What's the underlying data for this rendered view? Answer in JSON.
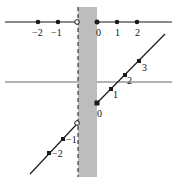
{
  "diagram": {
    "colors": {
      "line": "#1a1a1a",
      "band": "#bdbdbd",
      "axis": "#555555"
    },
    "top_line": {
      "left_points": [
        {
          "label": "−2",
          "x": 38
        },
        {
          "label": "−1",
          "x": 58
        }
      ],
      "open_point": {
        "x": 77
      },
      "right_points": [
        {
          "label": "0",
          "x": 97
        },
        {
          "label": "1",
          "x": 117
        },
        {
          "label": "2",
          "x": 137
        }
      ]
    },
    "slanted_line": {
      "upper_points": [
        {
          "label": "0",
          "x": 97,
          "y": 103
        },
        {
          "label": "1",
          "x": 111,
          "y": 89
        },
        {
          "label": "2",
          "x": 125,
          "y": 75
        },
        {
          "label": "3",
          "x": 139,
          "y": 61
        }
      ],
      "lower_points": [
        {
          "label": "−1",
          "x": 63,
          "y": 139
        },
        {
          "label": "−2",
          "x": 49,
          "y": 153
        }
      ],
      "open_point": {
        "x": 77,
        "y": 123
      }
    },
    "labels": {
      "top_m2": "−2",
      "top_m1": "−1",
      "top_0": "0",
      "top_1": "1",
      "top_2": "2",
      "slant_0": "0",
      "slant_1": "1",
      "slant_2": "2",
      "slant_3": "3",
      "slant_m1": "−1",
      "slant_m2": "−2"
    }
  }
}
